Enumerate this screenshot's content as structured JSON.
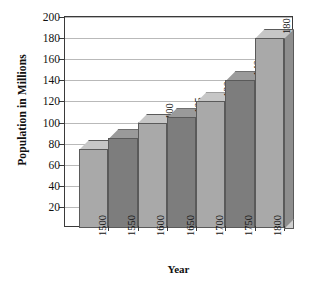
{
  "chart_data": {
    "type": "bar",
    "title": "",
    "subtitle": "",
    "xlabel": "Year",
    "ylabel": "Population in Millions",
    "categories": [
      "1500",
      "1550",
      "1600",
      "1650",
      "1700",
      "1750",
      "1800"
    ],
    "values": [
      75,
      85,
      100,
      105,
      120,
      140,
      180
    ],
    "point_labels": [
      "",
      "",
      "100",
      "105",
      "120",
      "140",
      "180"
    ],
    "series": [
      {
        "name": "Population in Millions",
        "values": [
          75,
          85,
          100,
          105,
          120,
          140,
          180
        ]
      }
    ],
    "ylim": [
      0,
      200
    ],
    "yticks": [
      20,
      40,
      60,
      80,
      100,
      120,
      140,
      160,
      180,
      200
    ],
    "ytick_labels": [
      "20",
      "40",
      "60",
      "80",
      "100",
      "120",
      "140",
      "160",
      "180",
      "200"
    ],
    "grid": true,
    "grid_axis": "y",
    "legend": false,
    "legend_position": "none",
    "style": "3d-column",
    "bar_colors": [
      "#a9a9a9",
      "#7d7d7d",
      "#a9a9a9",
      "#7d7d7d",
      "#a9a9a9",
      "#7d7d7d",
      "#a9a9a9"
    ],
    "colors": {
      "bar_light": "#a9a9a9",
      "bar_dark": "#7d7d7d",
      "bar_top_light": "#c6c6c6",
      "bar_top_dark": "#9a9a9a",
      "bar_side_light": "#8e8e8e",
      "bar_side_dark": "#6a6a6a",
      "bar_outline": "#5a5a5a",
      "axis": "#3a3a3a",
      "gridline": "#b9b9b9",
      "text": "#111111",
      "background": "#ffffff"
    }
  }
}
